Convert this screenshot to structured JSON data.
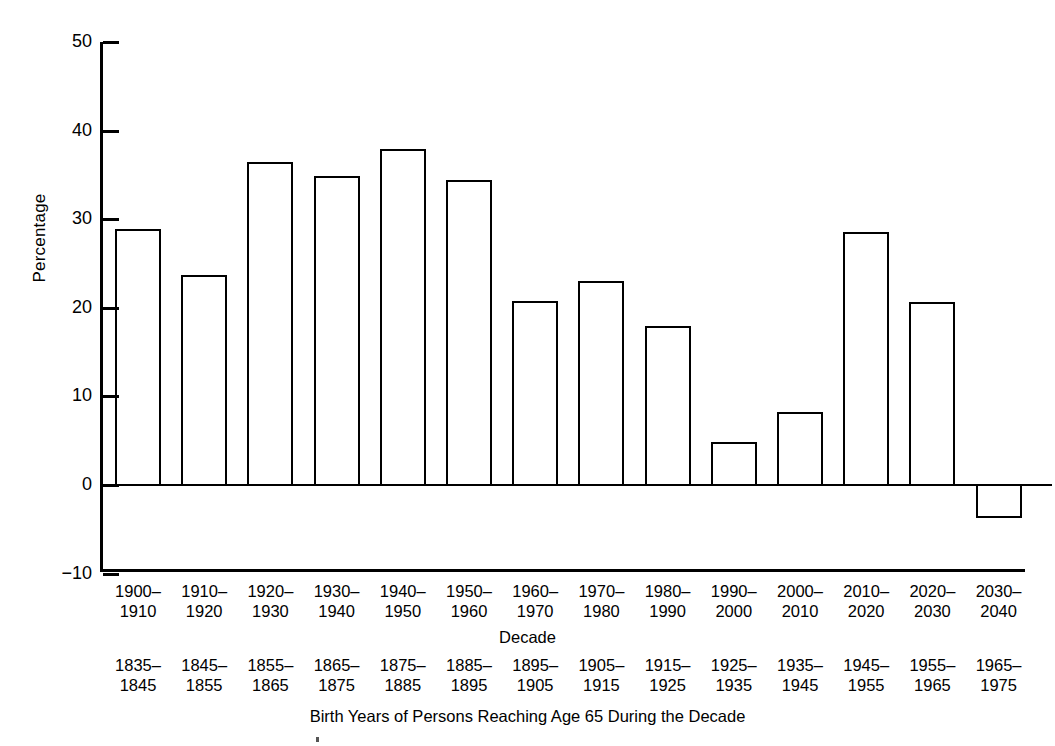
{
  "chart_data": {
    "type": "bar",
    "title": "",
    "xlabel": "Decade",
    "ylabel": "Percentage",
    "secondary_xlabel": "Birth Years of Persons Reaching Age 65 During the Decade",
    "ylim": [
      -10,
      50
    ],
    "ytick_labels": [
      "50",
      "40",
      "30",
      "20",
      "10",
      "0",
      "−10"
    ],
    "ytick_values": [
      50,
      40,
      30,
      20,
      10,
      0,
      -10
    ],
    "grid": false,
    "legend": "none",
    "categories": [
      "1900–1910",
      "1910–1920",
      "1920–1930",
      "1930–1940",
      "1940–1950",
      "1950–1960",
      "1960–1970",
      "1970–1980",
      "1980–1990",
      "1990–2000",
      "2000–2010",
      "2010–2020",
      "2020–2030",
      "2030–2040"
    ],
    "categories_line1": [
      "1900–",
      "1910–",
      "1920–",
      "1930–",
      "1940–",
      "1950–",
      "1960–",
      "1970–",
      "1980–",
      "1990–",
      "2000–",
      "2010–",
      "2020–",
      "2030–"
    ],
    "categories_line2": [
      "1910",
      "1920",
      "1930",
      "1940",
      "1950",
      "1960",
      "1970",
      "1980",
      "1990",
      "2000",
      "2010",
      "2020",
      "2030",
      "2040"
    ],
    "birth_years_line1": [
      "1835–",
      "1845–",
      "1855–",
      "1865–",
      "1875–",
      "1885–",
      "1895–",
      "1905–",
      "1915–",
      "1925–",
      "1935–",
      "1945–",
      "1955–",
      "1965–"
    ],
    "birth_years_line2": [
      "1845",
      "1855",
      "1865",
      "1875",
      "1885",
      "1895",
      "1905",
      "1915",
      "1925",
      "1935",
      "1945",
      "1955",
      "1965",
      "1975"
    ],
    "birth_years": [
      "1835–1845",
      "1845–1855",
      "1855–1865",
      "1865–1875",
      "1875–1885",
      "1885–1895",
      "1895–1905",
      "1905–1915",
      "1915–1925",
      "1925–1935",
      "1935–1945",
      "1945–1955",
      "1955–1965",
      "1965–1975"
    ],
    "values": [
      28.9,
      23.7,
      36.4,
      34.9,
      37.9,
      34.4,
      20.8,
      23.0,
      18.0,
      4.9,
      8.2,
      28.5,
      20.6,
      -3.7
    ],
    "bar_style": {
      "fill": "#ffffff",
      "edge": "#000000",
      "edge_width": 2
    }
  }
}
